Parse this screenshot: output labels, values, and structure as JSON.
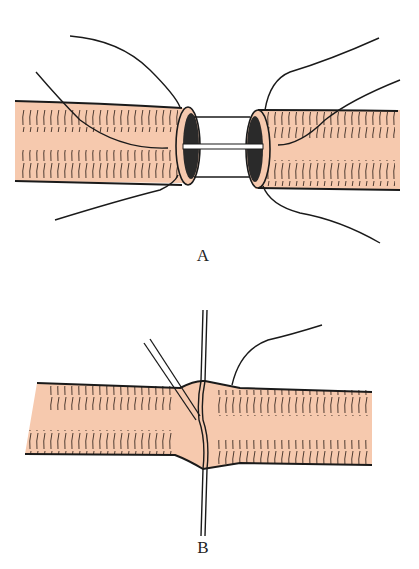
{
  "figure": {
    "panels": [
      {
        "id": "A",
        "label": "A",
        "description": "Two severed vessel ends aligned with stay sutures and an internal stent/tube bridging the gap"
      },
      {
        "id": "B",
        "label": "B",
        "description": "Vessel ends joined; needle and suture passing through the anastomosis"
      }
    ],
    "colors": {
      "vessel_fill": "#f6c9ae",
      "ink": "#1a1a1a",
      "lumen": "#2a2a2a",
      "background": "#ffffff"
    }
  }
}
